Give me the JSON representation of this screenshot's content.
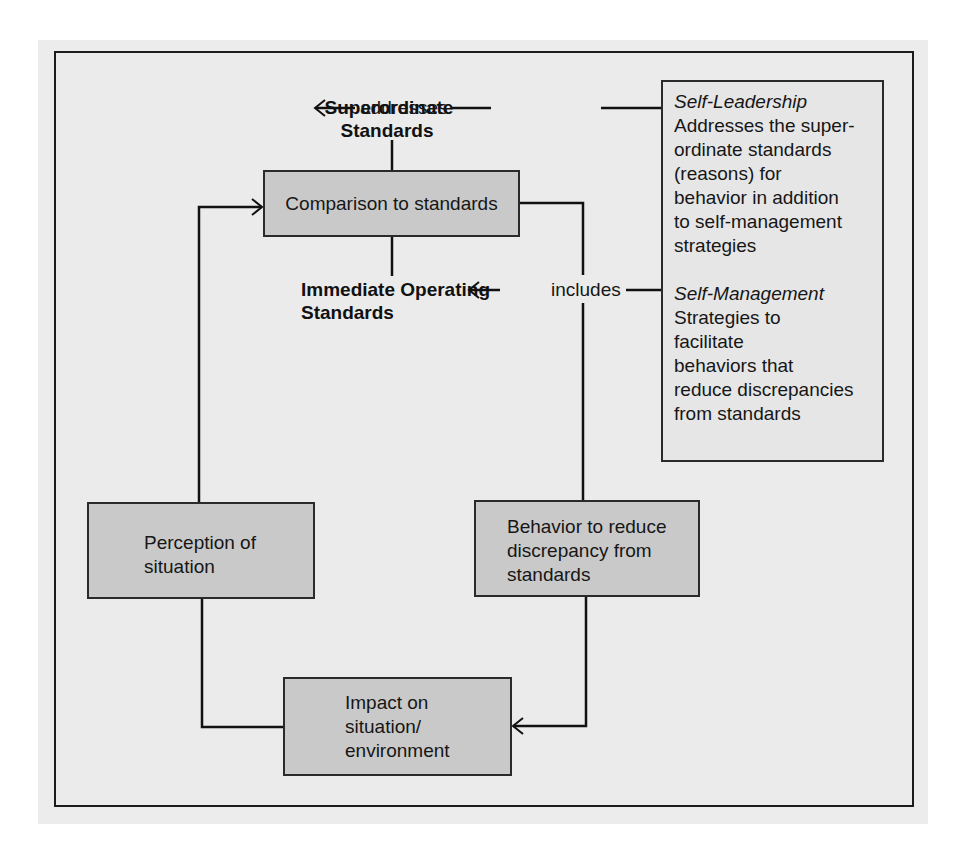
{
  "diagram": {
    "nodes": {
      "comparison": {
        "label": "Comparison to standards"
      },
      "perception": {
        "label_line1": "Perception of",
        "label_line2": "situation"
      },
      "behavior": {
        "label_line1": "Behavior to reduce",
        "label_line2": "discrepancy from",
        "label_line3": "standards"
      },
      "impact": {
        "label_line1": "Impact on",
        "label_line2": "situation/",
        "label_line3": "environment"
      }
    },
    "standards": {
      "superordinate": {
        "line1": "Superordinate",
        "line2": "Standards"
      },
      "immediate": {
        "line1": "Immediate Operating",
        "line2": "Standards"
      }
    },
    "connectors": {
      "addresses": "addresses",
      "includes": "includes"
    },
    "side_panel": {
      "self_leadership": {
        "title": "Self-Leadership",
        "lines": [
          "Addresses the super-",
          "ordinate standards",
          "(reasons) for",
          "behavior in addition",
          "to self-management",
          "strategies"
        ]
      },
      "self_management": {
        "title": "Self-Management",
        "lines": [
          "Strategies to",
          "facilitate",
          "behaviors that",
          "reduce discrepancies",
          "from standards"
        ]
      }
    },
    "colors": {
      "box_fill": "#c9c9c9",
      "panel_fill": "#e6e6e6",
      "background": "#ebebeb",
      "line": "#111111"
    }
  }
}
